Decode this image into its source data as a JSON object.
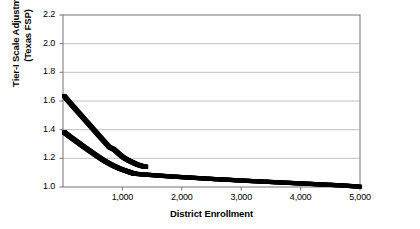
{
  "chart_data": {
    "type": "line",
    "title": "",
    "xlabel": "District Enrollment",
    "ylabel": "Tier-I Scale Adjustment (Texas FSP)",
    "ylabel_line1": "Tier-I Scale Adjustment",
    "ylabel_line2": "(Texas FSP)",
    "xlim": [
      0,
      5000
    ],
    "ylim": [
      1.0,
      2.2
    ],
    "xticks": [
      1000,
      2000,
      3000,
      4000,
      5000
    ],
    "xtick_labels": [
      "1,000",
      "2,000",
      "3,000",
      "4,000",
      "5,000"
    ],
    "yticks": [
      1.0,
      1.2,
      1.4,
      1.6,
      1.8,
      2.0,
      2.2
    ],
    "ytick_labels": [
      "1.0",
      "1.2",
      "1.4",
      "1.6",
      "1.8",
      "2.0",
      "2.2"
    ],
    "grid": "horizontal",
    "grid_color": "#b0b0b0",
    "frame_color": "#808080",
    "series_color": "#000000",
    "legend": "none",
    "series": [
      {
        "name": "upper-adjustment",
        "marker": "square",
        "x": [
          20,
          80,
          150,
          220,
          300,
          380,
          460,
          540,
          620,
          700,
          780,
          860,
          940,
          1020,
          1100,
          1180,
          1260,
          1340,
          1400
        ],
        "values": [
          1.635,
          1.605,
          1.572,
          1.539,
          1.502,
          1.464,
          1.427,
          1.389,
          1.352,
          1.315,
          1.278,
          1.262,
          1.232,
          1.205,
          1.186,
          1.17,
          1.155,
          1.145,
          1.14
        ]
      },
      {
        "name": "lower-adjustment",
        "marker": "square",
        "x": [
          20,
          80,
          150,
          220,
          300,
          380,
          460,
          540,
          620,
          700,
          780,
          860,
          940,
          1020,
          1100,
          1160,
          1220
        ],
        "values": [
          1.382,
          1.363,
          1.341,
          1.32,
          1.296,
          1.272,
          1.249,
          1.226,
          1.203,
          1.182,
          1.163,
          1.146,
          1.131,
          1.118,
          1.107,
          1.098,
          1.092
        ]
      },
      {
        "name": "tail-adjustment",
        "marker": "square",
        "x": [
          1220,
          1400,
          1600,
          1800,
          2000,
          2200,
          2400,
          2600,
          2800,
          3000,
          3200,
          3400,
          3600,
          3800,
          4000,
          4200,
          4400,
          4600,
          4800,
          5000
        ],
        "values": [
          1.092,
          1.086,
          1.08,
          1.074,
          1.069,
          1.064,
          1.059,
          1.054,
          1.05,
          1.045,
          1.041,
          1.037,
          1.033,
          1.029,
          1.025,
          1.021,
          1.017,
          1.013,
          1.008,
          1.002
        ]
      }
    ]
  }
}
